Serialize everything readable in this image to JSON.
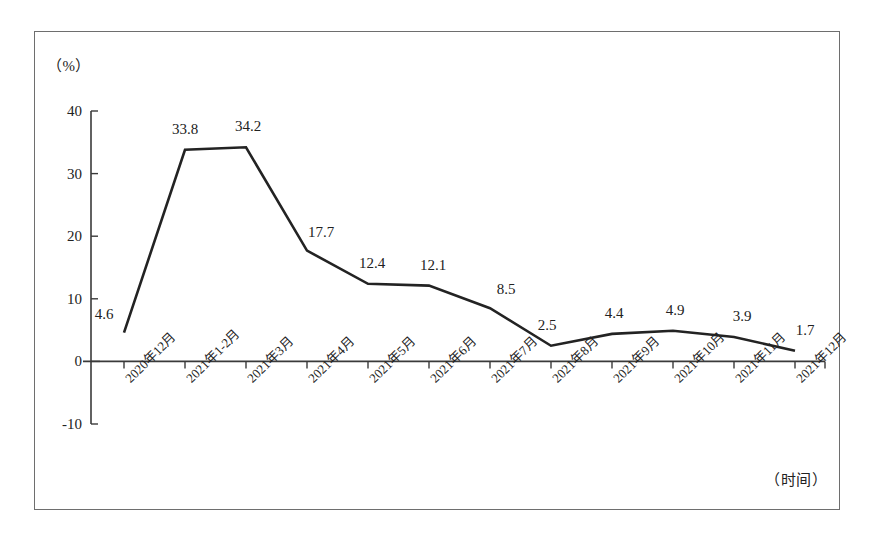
{
  "chart_data": {
    "type": "line",
    "title": "",
    "subtitle": "",
    "xlabel": "（时间）",
    "ylabel": "（%）",
    "categories": [
      "2020年12月",
      "2021年1-2月",
      "2021年3月",
      "2021年4月",
      "2021年5月",
      "2021年6月",
      "2021年7月",
      "2021年8月",
      "2021年9月",
      "2021年10月",
      "2021年11月",
      "2021年12月"
    ],
    "values": [
      4.6,
      33.8,
      34.2,
      17.7,
      12.4,
      12.1,
      8.5,
      2.5,
      4.4,
      4.9,
      3.9,
      1.7
    ],
    "point_labels": [
      "4.6",
      "33.8",
      "34.2",
      "17.7",
      "12.4",
      "12.1",
      "8.5",
      "2.5",
      "4.4",
      "4.9",
      "3.9",
      "1.7"
    ],
    "ylim": [
      -10,
      40
    ],
    "yticks": [
      40,
      30,
      20,
      10,
      0,
      -10
    ],
    "ytick_labels": [
      "40",
      "30",
      "20",
      "10",
      "0",
      "-10"
    ],
    "grid": false,
    "legend": null,
    "series_color": "#232323",
    "axis_color": "#3a3a3a",
    "frame_color": "#6e6e6e",
    "background": "#ffffff"
  },
  "axis_captions": {
    "unit": "（%）",
    "time": "（时间）"
  }
}
